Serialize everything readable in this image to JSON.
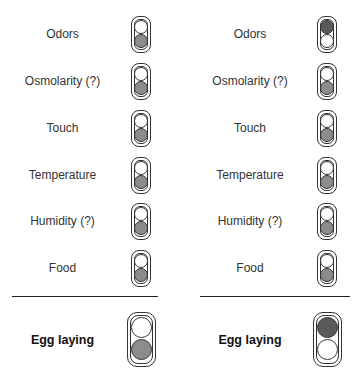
{
  "left_panel": {
    "rows": [
      {
        "label": "Odors",
        "state": "bottom"
      },
      {
        "label": "Osmolarity (?)",
        "state": "bottom"
      },
      {
        "label": "Touch",
        "state": "bottom"
      },
      {
        "label": "Temperature",
        "state": "bottom"
      },
      {
        "label": "Humidity (?)",
        "state": "bottom"
      },
      {
        "label": "Food",
        "state": "bottom"
      }
    ],
    "output": {
      "label": "Egg laying",
      "state": "bottom"
    }
  },
  "right_panel": {
    "rows": [
      {
        "label": "Odors",
        "state": "top"
      },
      {
        "label": "Osmolarity (?)",
        "state": "bottom"
      },
      {
        "label": "Touch",
        "state": "bottom"
      },
      {
        "label": "Temperature",
        "state": "bottom"
      },
      {
        "label": "Humidity (?)",
        "state": "bottom"
      },
      {
        "label": "Food",
        "state": "bottom"
      }
    ],
    "output": {
      "label": "Egg laying",
      "state": "top"
    }
  },
  "colors": {
    "lamp_on_bottom": "#8c8c8c",
    "lamp_on_top": "#5a5a5a",
    "lamp_off": "#ffffff",
    "outline": "#333333"
  }
}
